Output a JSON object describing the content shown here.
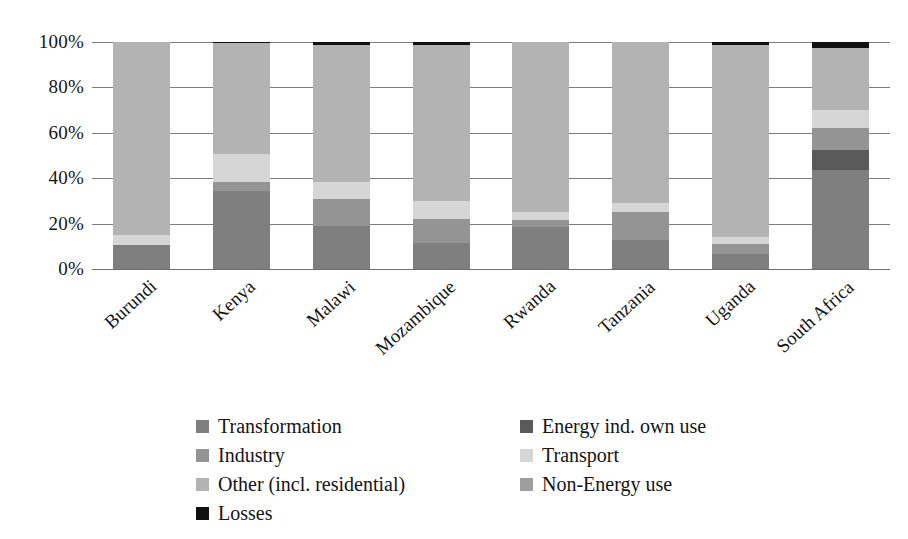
{
  "chart_data": {
    "type": "bar",
    "subtype": "stacked-100-percent",
    "title": "",
    "xlabel": "",
    "ylabel": "",
    "ylim": [
      0,
      100
    ],
    "ytick_labels": [
      "100%",
      "80%",
      "60%",
      "40%",
      "20%",
      "0%"
    ],
    "ytick_values": [
      100,
      80,
      60,
      40,
      20,
      0
    ],
    "grid": true,
    "legend_position": "bottom",
    "categories": [
      "Burundi",
      "Kenya",
      "Malawi",
      "Mozambique",
      "Rwanda",
      "Tanzania",
      "Uganda",
      "South Africa"
    ],
    "series": [
      {
        "name": "Transformation",
        "color": "#7f7f7f",
        "values": [
          10.5,
          34.5,
          18.8,
          11.5,
          18.3,
          13.0,
          6.5,
          43.5
        ]
      },
      {
        "name": "Energy ind. own use",
        "color": "#5a5a5a",
        "values": [
          0.0,
          0.0,
          0.0,
          0.0,
          0.0,
          0.0,
          0.0,
          9.0
        ]
      },
      {
        "name": "Industry",
        "color": "#949494",
        "values": [
          0.0,
          4.0,
          12.0,
          10.5,
          3.5,
          12.0,
          4.5,
          9.5
        ]
      },
      {
        "name": "Transport",
        "color": "#d6d6d6",
        "values": [
          4.5,
          12.0,
          7.5,
          8.0,
          3.5,
          4.0,
          3.0,
          8.0
        ]
      },
      {
        "name": "Other (incl. residential)",
        "color": "#b3b3b3",
        "values": [
          85.0,
          49.0,
          60.2,
          68.5,
          74.7,
          71.0,
          84.5,
          27.5
        ]
      },
      {
        "name": "Non-Energy use",
        "color": "#9e9e9e",
        "values": [
          0.0,
          0.0,
          0.0,
          0.0,
          0.0,
          0.0,
          0.0,
          0.0
        ]
      },
      {
        "name": "Losses",
        "color": "#111111",
        "values": [
          0.0,
          0.5,
          1.5,
          1.5,
          0.0,
          0.0,
          1.5,
          2.5
        ]
      }
    ]
  },
  "legend": {
    "items": [
      {
        "label": "Transformation",
        "color": "#7f7f7f",
        "column": "left"
      },
      {
        "label": "Energy ind. own use",
        "color": "#5a5a5a",
        "column": "right"
      },
      {
        "label": "Industry",
        "color": "#949494",
        "column": "left"
      },
      {
        "label": "Transport",
        "color": "#d6d6d6",
        "column": "right"
      },
      {
        "label": "Other (incl. residential)",
        "color": "#b3b3b3",
        "column": "left"
      },
      {
        "label": "Non-Energy use",
        "color": "#9e9e9e",
        "column": "right"
      },
      {
        "label": "Losses",
        "color": "#111111",
        "column": "left"
      }
    ]
  },
  "colors": {
    "background": "#ffffff",
    "gridline": "#7d7d7d",
    "text": "#141414"
  }
}
